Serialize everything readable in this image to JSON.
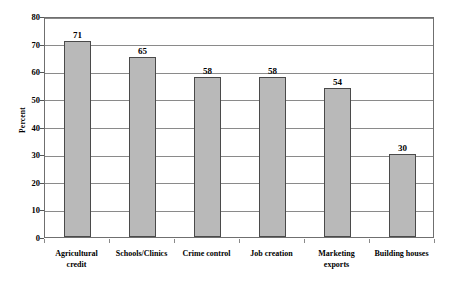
{
  "chart_data": {
    "type": "bar",
    "title": "",
    "subtitle": "",
    "xlabel": "",
    "ylabel": "Percent",
    "categories": [
      "Agricultural\ncredit",
      "Schools/Clinics",
      "Crime control",
      "Job creation",
      "Marketing\nexports",
      "Building houses"
    ],
    "values": [
      71,
      65,
      58,
      58,
      54,
      30
    ],
    "value_labels": [
      "71",
      "65",
      "58",
      "58",
      "54",
      "30"
    ],
    "ylim": [
      0,
      80
    ],
    "ytick_step": 10,
    "ytick_labels": [
      "0",
      "10",
      "20",
      "30",
      "40",
      "50",
      "60",
      "70",
      "80"
    ],
    "grid": true,
    "grid_axis": "y",
    "legend": false,
    "legend_position": "none",
    "bar_fill_color": "#b9b9b9",
    "bar_border_color": "#4a4a4a",
    "gridline_color": "#8a8a8a",
    "frame_color": "#6f6f6f",
    "background_color": "#ffffff",
    "text_color": "#000000"
  }
}
